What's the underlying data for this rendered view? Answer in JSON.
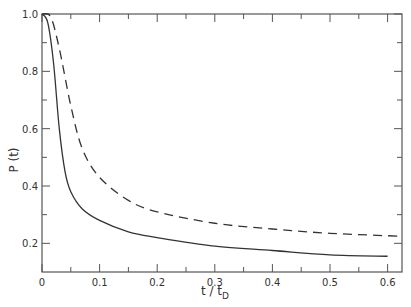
{
  "chart_data": {
    "type": "line",
    "title": "",
    "xlabel": "t / t_D",
    "ylabel": "P (t)",
    "xlim": [
      0,
      0.625
    ],
    "ylim": [
      0.1,
      1.0
    ],
    "grid": false,
    "legend": null,
    "x_ticks": [
      "0",
      "0.1",
      "0.2",
      "0.3",
      "0.4",
      "0.5",
      "0.6"
    ],
    "y_ticks": [
      "0.2",
      "0.4",
      "0.6",
      "0.8",
      "1.0"
    ],
    "series": [
      {
        "name": "solid",
        "style": "solid",
        "x": [
          0,
          0.01,
          0.02,
          0.03,
          0.04,
          0.05,
          0.07,
          0.1,
          0.15,
          0.2,
          0.3,
          0.4,
          0.5,
          0.6
        ],
        "y": [
          1.0,
          0.97,
          0.83,
          0.6,
          0.45,
          0.38,
          0.32,
          0.28,
          0.24,
          0.22,
          0.19,
          0.175,
          0.16,
          0.155
        ]
      },
      {
        "name": "dashed",
        "style": "dashed",
        "x": [
          0,
          0.015,
          0.03,
          0.05,
          0.07,
          0.1,
          0.15,
          0.2,
          0.3,
          0.4,
          0.5,
          0.62
        ],
        "y": [
          1.0,
          0.99,
          0.88,
          0.68,
          0.53,
          0.43,
          0.35,
          0.31,
          0.27,
          0.25,
          0.235,
          0.225
        ]
      }
    ]
  },
  "axes": {
    "x_label_main": "t / t",
    "x_label_sub": "D",
    "y_label": "P (t)"
  }
}
